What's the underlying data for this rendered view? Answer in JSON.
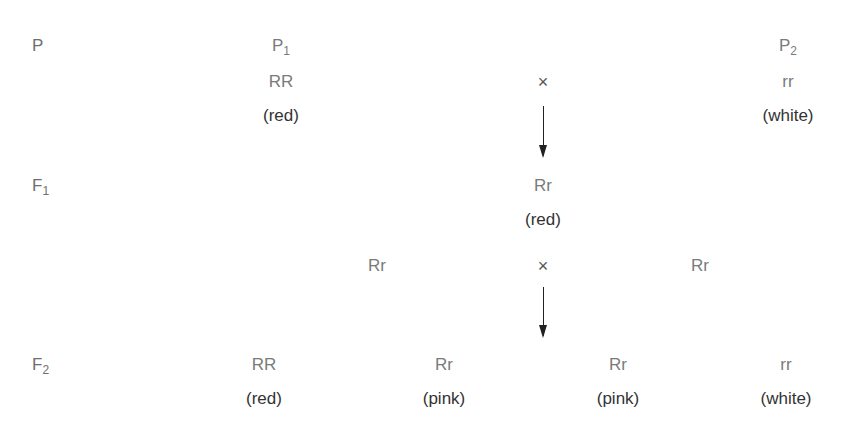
{
  "generations": {
    "p": {
      "label": "P",
      "sub": ""
    },
    "f1": {
      "label": "F",
      "sub": "1"
    },
    "f2": {
      "label": "F",
      "sub": "2"
    }
  },
  "parents": {
    "p1": {
      "name": "P",
      "sub": "1",
      "genotype": "RR",
      "phenotype": "(red)"
    },
    "p2": {
      "name": "P",
      "sub": "2",
      "genotype": "rr",
      "phenotype": "(white)"
    },
    "cross_symbol": "×"
  },
  "f1": {
    "offspring": {
      "genotype": "Rr",
      "phenotype": "(red)"
    },
    "selfing": {
      "left": "Rr",
      "right": "Rr",
      "cross_symbol": "×"
    }
  },
  "f2": {
    "offspring": [
      {
        "genotype": "RR",
        "phenotype": "(red)"
      },
      {
        "genotype": "Rr",
        "phenotype": "(pink)"
      },
      {
        "genotype": "Rr",
        "phenotype": "(pink)"
      },
      {
        "genotype": "rr",
        "phenotype": "(white)"
      }
    ]
  },
  "colors": {
    "genotype": "#7a7a7a",
    "phenotype": "#333333",
    "arrow": "#222222"
  }
}
